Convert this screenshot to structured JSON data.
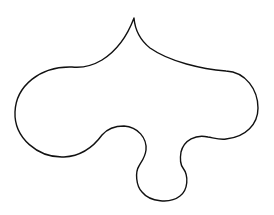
{
  "figure": {
    "type": "closed-curve-outline",
    "stroke_color": "#111111",
    "background_color": "#ffffff",
    "labels": []
  }
}
